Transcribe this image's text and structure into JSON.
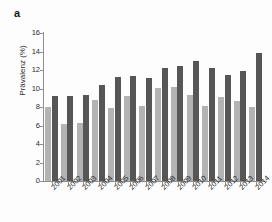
{
  "panel": {
    "label": "a"
  },
  "chart_data": {
    "type": "bar",
    "title": "",
    "xlabel": "",
    "ylabel": "Prävalenz (%)",
    "ylim": [
      0,
      16
    ],
    "ytick_labels": [
      "16",
      "14",
      "12",
      "10",
      "8",
      "6",
      "4",
      "2",
      "0"
    ],
    "ytick_values": [
      16,
      14,
      12,
      10,
      8,
      6,
      4,
      2,
      0
    ],
    "grid": false,
    "legend": "none",
    "categories": [
      "2001",
      "2002",
      "2003",
      "2004",
      "2005",
      "2006",
      "2007",
      "2008",
      "2009",
      "2010",
      "2011",
      "2012",
      "2013",
      "2014"
    ],
    "series": [
      {
        "name": "light-gray-series",
        "color": "#b3b3b3",
        "values": [
          8.0,
          6.2,
          6.3,
          8.8,
          7.9,
          9.2,
          8.1,
          10.1,
          10.2,
          9.3,
          8.1,
          9.1,
          8.6,
          8.0
        ]
      },
      {
        "name": "dark-gray-series",
        "color": "#565656",
        "values": [
          9.2,
          9.2,
          9.3,
          10.4,
          11.2,
          11.3,
          11.1,
          12.2,
          12.4,
          13.0,
          12.2,
          11.5,
          11.9,
          13.8
        ]
      }
    ]
  }
}
